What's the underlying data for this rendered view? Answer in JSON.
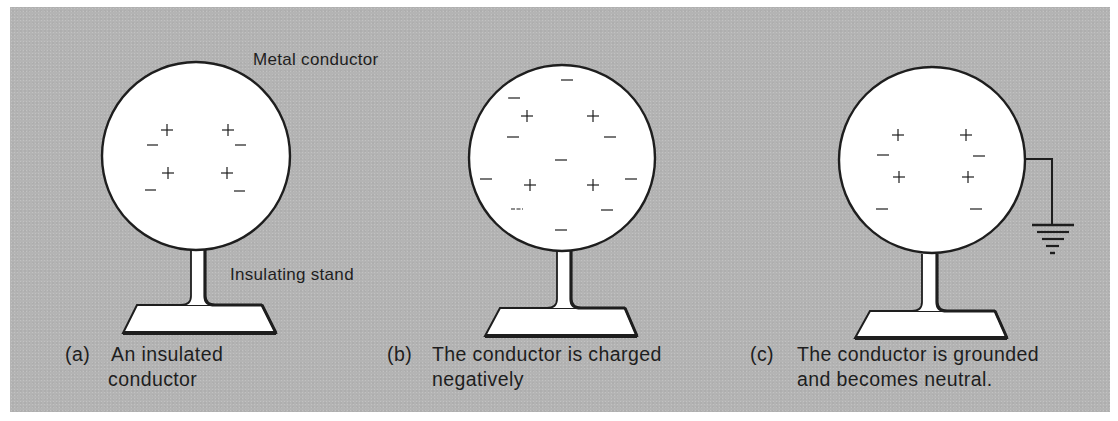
{
  "figure": {
    "background_color": "#b4b4b4",
    "sphere_fill": "#ffffff",
    "stroke_color": "#1e1e1e",
    "annotations": {
      "metal_conductor": "Metal conductor",
      "insulating_stand": "Insulating stand"
    },
    "panels": [
      {
        "id": "a",
        "tag": "(a)",
        "caption_lines": [
          "An insulated",
          "conductor"
        ],
        "state": "insulated, neutral",
        "positive_charges": 4,
        "negative_charges": 4,
        "grounded": false
      },
      {
        "id": "b",
        "tag": "(b)",
        "caption_lines": [
          "The conductor is charged",
          "negatively"
        ],
        "state": "charged negatively",
        "positive_charges": 4,
        "negative_charges": 10,
        "grounded": false
      },
      {
        "id": "c",
        "tag": "(c)",
        "caption_lines": [
          "The conductor is grounded",
          "and becomes neutral."
        ],
        "state": "grounded, neutral",
        "positive_charges": 4,
        "negative_charges": 4,
        "grounded": true
      }
    ],
    "charge_symbols": {
      "positive": "+",
      "negative": "−"
    }
  }
}
